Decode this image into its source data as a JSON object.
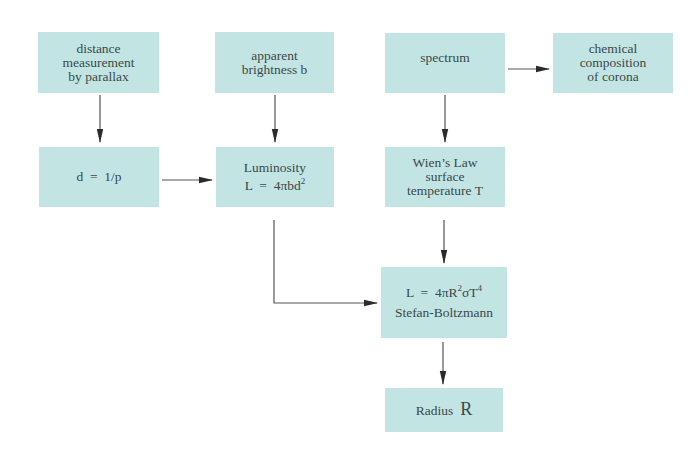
{
  "diagram": {
    "colors": {
      "box_fill": "#c2e5e4",
      "text": "#3b4848",
      "arrow": "#333333"
    },
    "nodes": {
      "parallax": {
        "lines": [
          "distance",
          "measurement",
          "by parallax"
        ]
      },
      "brightness": {
        "lines": [
          "apparent",
          "brightness b"
        ]
      },
      "spectrum": {
        "lines": [
          "spectrum"
        ]
      },
      "corona": {
        "lines": [
          "chemical",
          "composition",
          "of corona"
        ]
      },
      "distance": {
        "formula_left": "d",
        "formula_eq": "=",
        "formula_right": "1/p"
      },
      "luminosity": {
        "title": "Luminosity",
        "formula_left": "L",
        "formula_eq": "=",
        "formula_right": "4πbd",
        "formula_sup": "2"
      },
      "wien": {
        "lines": [
          "Wien’s Law",
          "surface",
          "temperature T"
        ]
      },
      "stefan": {
        "formula_left": "L",
        "formula_eq": "=",
        "formula_a": "4πR",
        "formula_sup1": "2",
        "formula_b": "σT",
        "formula_sup2": "4",
        "name": "Stefan-Boltzmann"
      },
      "radius": {
        "label": "Radius",
        "symbol": "R"
      }
    },
    "edges": [
      {
        "from": "parallax",
        "to": "distance"
      },
      {
        "from": "brightness",
        "to": "luminosity"
      },
      {
        "from": "spectrum",
        "to": "corona"
      },
      {
        "from": "spectrum",
        "to": "wien"
      },
      {
        "from": "distance",
        "to": "luminosity"
      },
      {
        "from": "luminosity",
        "to": "stefan"
      },
      {
        "from": "wien",
        "to": "stefan"
      },
      {
        "from": "stefan",
        "to": "radius"
      }
    ]
  }
}
